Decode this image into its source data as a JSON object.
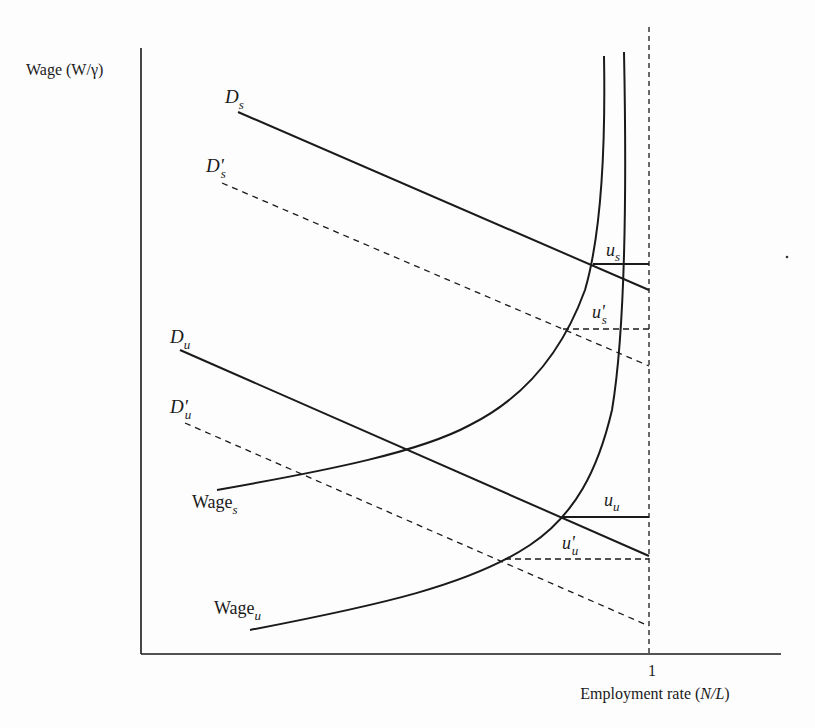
{
  "diagram": {
    "type": "economics-labor-market",
    "y_axis_label": "Wage (W/γ)",
    "x_axis_label_prefix": "Employment rate (",
    "x_axis_label_var": "N/L",
    "x_axis_label_suffix": ")",
    "x_tick": "1",
    "curves": {
      "demand_skilled": {
        "base": "D",
        "sub": "s"
      },
      "demand_skilled_shifted": {
        "base": "D'",
        "sub": "s"
      },
      "demand_unskilled": {
        "base": "D",
        "sub": "u"
      },
      "demand_unskilled_shifted": {
        "base": "D'",
        "sub": "u"
      },
      "wage_skilled": {
        "base": "Wage",
        "sub": "s"
      },
      "wage_unskilled": {
        "base": "Wage",
        "sub": "u"
      }
    },
    "gaps": {
      "u_s": {
        "base": "u",
        "sub": "s"
      },
      "u_s_shifted": {
        "base": "u'",
        "sub": "s"
      },
      "u_u": {
        "base": "u",
        "sub": "u"
      },
      "u_u_shifted": {
        "base": "u'",
        "sub": "u"
      }
    },
    "colors": {
      "ink": "#1a1a1a",
      "background": "#fdfdfd"
    }
  }
}
